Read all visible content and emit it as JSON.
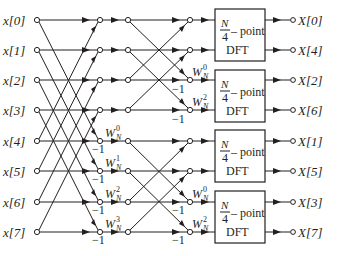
{
  "diagram": {
    "type": "signal-flow-graph",
    "title": "",
    "inputs": [
      "x[0]",
      "x[1]",
      "x[2]",
      "x[3]",
      "x[4]",
      "x[5]",
      "x[6]",
      "x[7]"
    ],
    "outputs": [
      "X[0]",
      "X[4]",
      "X[2]",
      "X[6]",
      "X[1]",
      "X[5]",
      "X[3]",
      "X[7]"
    ],
    "stage1_twiddles": [
      {
        "base": "W",
        "sub": "N",
        "sup": "0"
      },
      {
        "base": "W",
        "sub": "N",
        "sup": "1"
      },
      {
        "base": "W",
        "sub": "N",
        "sup": "2"
      },
      {
        "base": "W",
        "sub": "N",
        "sup": "3"
      }
    ],
    "stage2_twiddles": [
      {
        "base": "W",
        "sub": "N",
        "sup": "0"
      },
      {
        "base": "W",
        "sub": "N",
        "sup": "2"
      },
      {
        "base": "W",
        "sub": "N",
        "sup": "0"
      },
      {
        "base": "W",
        "sub": "N",
        "sup": "2"
      }
    ],
    "minus_one_label": "−1",
    "dft_blocks": [
      {
        "num": "N",
        "den": "4",
        "suffix": "– point",
        "name": "DFT"
      },
      {
        "num": "N",
        "den": "4",
        "suffix": "– point",
        "name": "DFT"
      },
      {
        "num": "N",
        "den": "4",
        "suffix": "– point",
        "name": "DFT"
      },
      {
        "num": "N",
        "den": "4",
        "suffix": "– point",
        "name": "DFT"
      }
    ],
    "colors": {
      "ink": "#231f20",
      "background": "#ffffff"
    }
  }
}
